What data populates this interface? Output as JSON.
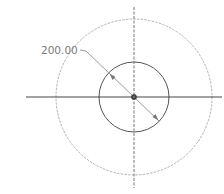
{
  "drawing": {
    "type": "cad-sketch",
    "center": {
      "x": 134,
      "y": 97
    },
    "outer_circle": {
      "radius": 78,
      "color": "#a8a8a8",
      "style": "dashed"
    },
    "inner_circle": {
      "radius": 35,
      "color": "#555555",
      "style": "solid"
    },
    "horizontal_axis": {
      "x1": 26,
      "x2": 222,
      "color": "#444444"
    },
    "vertical_axis": {
      "y1": 7,
      "y2": 188,
      "color": "#777777",
      "style": "dashed"
    },
    "dimension": {
      "label": "200.00",
      "kind": "diameter",
      "color": "#8a8a8a"
    }
  }
}
